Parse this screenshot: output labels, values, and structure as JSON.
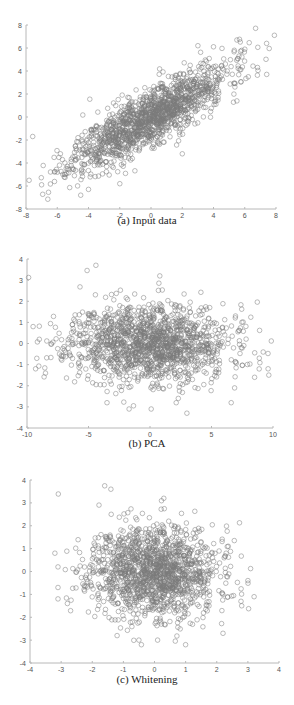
{
  "marker_color": "#7a7a7a",
  "axis_color": "#b8b8b8",
  "chart_data": [
    {
      "id": "a",
      "type": "scatter",
      "title": "",
      "caption": "(a) Input data",
      "xlabel": "",
      "ylabel": "",
      "xlim": [
        -8,
        8
      ],
      "ylim": [
        -8,
        8
      ],
      "xticks": [
        -8,
        -6,
        -4,
        -2,
        0,
        2,
        4,
        6,
        8
      ],
      "yticks": [
        -8,
        -6,
        -4,
        -2,
        0,
        2,
        4,
        6,
        8
      ],
      "grid": false,
      "marker": "open-circle",
      "series": [
        {
          "name": "input",
          "distribution": {
            "kind": "gaussian",
            "n": 1500,
            "mean": [
              0,
              0
            ],
            "cov": [
              [
                6.0,
                4.6
              ],
              [
                4.6,
                5.0
              ]
            ],
            "seed": 11
          },
          "points": [
            [
              -7.8,
              -5.5
            ],
            [
              -7.0,
              -5.9
            ],
            [
              -6.0,
              -4.8
            ],
            [
              -5.8,
              -3.2
            ],
            [
              -4.5,
              -6.8
            ],
            [
              -4.0,
              -6.3
            ],
            [
              -2.0,
              -5.8
            ],
            [
              7.9,
              7.1
            ],
            [
              7.4,
              6.4
            ],
            [
              6.0,
              5.9
            ],
            [
              5.5,
              6.7
            ],
            [
              3.0,
              6.2
            ],
            [
              2.0,
              -3.2
            ],
            [
              5.5,
              1.4
            ],
            [
              4.0,
              6.1
            ]
          ]
        }
      ]
    },
    {
      "id": "b",
      "type": "scatter",
      "title": "",
      "caption": "(b) PCA",
      "xlabel": "",
      "ylabel": "",
      "xlim": [
        -10,
        10
      ],
      "ylim": [
        -4,
        4
      ],
      "xticks": [
        -10,
        -5,
        0,
        5,
        10
      ],
      "yticks": [
        -4,
        -3,
        -2,
        -1,
        0,
        1,
        2,
        3,
        4
      ],
      "grid": false,
      "marker": "open-circle",
      "series": [
        {
          "name": "pca",
          "distribution": {
            "kind": "gaussian",
            "n": 1500,
            "mean": [
              0,
              0
            ],
            "cov": [
              [
                10.2,
                0
              ],
              [
                0,
                0.85
              ]
            ],
            "seed": 11
          },
          "points": [
            [
              -9.5,
              0.8
            ],
            [
              -9.2,
              -0.7
            ],
            [
              -9.0,
              0.2
            ],
            [
              -8.5,
              -1.4
            ],
            [
              -9.3,
              -1.2
            ],
            [
              -4.4,
              3.7
            ],
            [
              0.8,
              3.2
            ],
            [
              9.6,
              -1.2
            ],
            [
              9.2,
              -0.4
            ],
            [
              8.5,
              -1.6
            ],
            [
              3.0,
              -3.3
            ],
            [
              -1.7,
              -3.1
            ],
            [
              0.1,
              -3.1
            ],
            [
              6.6,
              -2.8
            ],
            [
              -3.5,
              -2.8
            ]
          ]
        }
      ]
    },
    {
      "id": "c",
      "type": "scatter",
      "title": "",
      "caption": "(c) Whitening",
      "xlabel": "",
      "ylabel": "",
      "xlim": [
        -4,
        4
      ],
      "ylim": [
        -4,
        4
      ],
      "xticks": [
        -4,
        -3,
        -2,
        -1,
        0,
        1,
        2,
        3,
        4
      ],
      "yticks": [
        -4,
        -3,
        -2,
        -1,
        0,
        1,
        2,
        3,
        4
      ],
      "grid": false,
      "marker": "open-circle",
      "series": [
        {
          "name": "whitened",
          "distribution": {
            "kind": "gaussian",
            "n": 1500,
            "mean": [
              0,
              0
            ],
            "cov": [
              [
                1.0,
                0
              ],
              [
                0,
                1.0
              ]
            ],
            "seed": 11
          },
          "points": [
            [
              -3.2,
              0.8
            ],
            [
              -3.1,
              -0.7
            ],
            [
              -3.1,
              0.2
            ],
            [
              -2.8,
              -1.4
            ],
            [
              -3.1,
              -1.2
            ],
            [
              -1.4,
              3.6
            ],
            [
              0.3,
              3.2
            ],
            [
              3.2,
              -1.1
            ],
            [
              3.0,
              -0.4
            ],
            [
              2.8,
              -1.5
            ],
            [
              1.0,
              -3.2
            ],
            [
              -0.5,
              -3.0
            ],
            [
              0.1,
              -3.0
            ],
            [
              2.2,
              -2.7
            ],
            [
              -1.2,
              -2.8
            ]
          ]
        }
      ]
    }
  ],
  "layout": [
    {
      "top": 0,
      "height": 232,
      "plot": {
        "x0": 26,
        "x1": 276,
        "y0": 25,
        "y1": 209
      },
      "caption_top": 214
    },
    {
      "top": 232,
      "height": 228,
      "plot": {
        "x0": 27,
        "x1": 273,
        "y0": 259,
        "y1": 428
      },
      "caption_top": 437
    },
    {
      "top": 460,
      "height": 245,
      "plot": {
        "x0": 30,
        "x1": 279,
        "y0": 480,
        "y1": 663
      },
      "caption_top": 673
    }
  ]
}
